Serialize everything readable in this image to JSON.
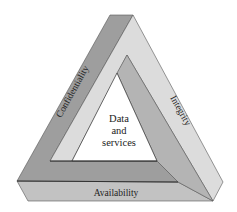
{
  "diagram": {
    "center_label": [
      "Data",
      "and",
      "services"
    ],
    "edges": {
      "left": "Confidentiality",
      "right": "Integrity",
      "bottom": "Availability"
    },
    "colors": {
      "dark_band": "#9e9e9e",
      "mid_band": "#b4b4b4",
      "light_band": "#dcdcdc",
      "bottom_band": "#c2c2c2",
      "inner_fill": "#ffffff",
      "outline": "#333333",
      "text": "#222222"
    }
  }
}
